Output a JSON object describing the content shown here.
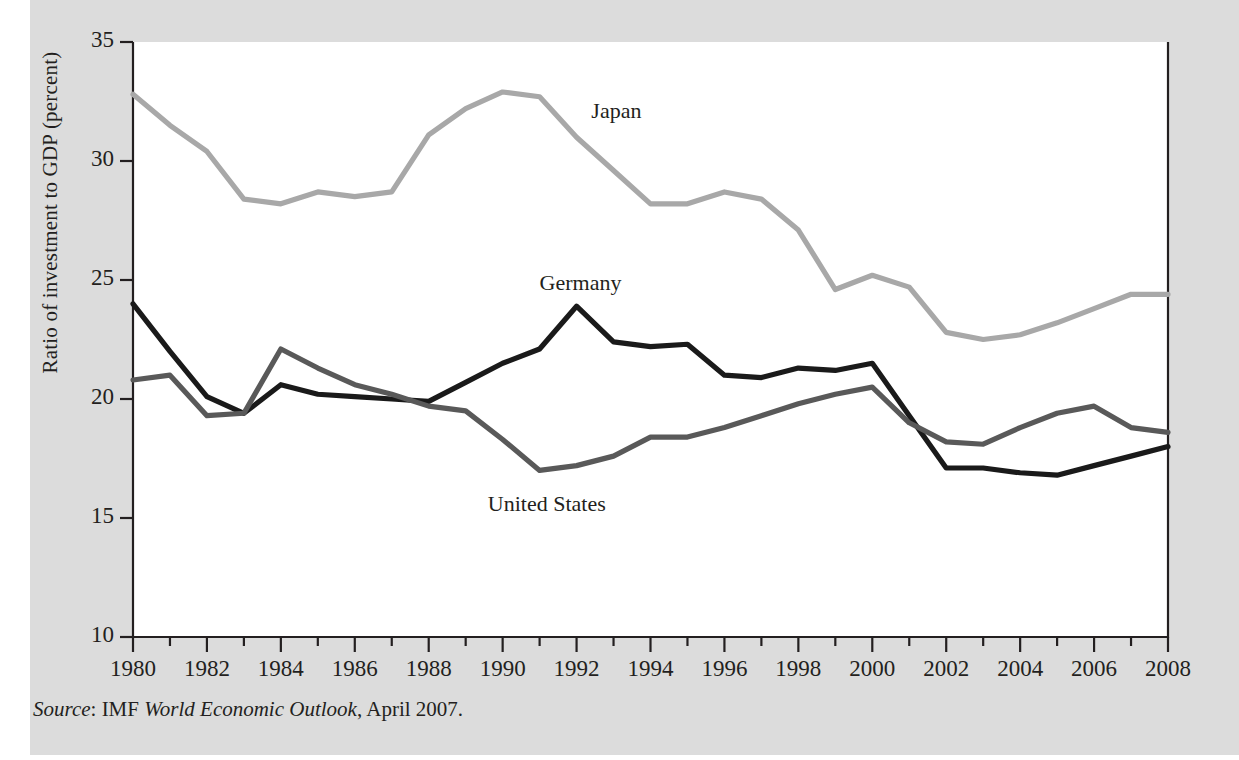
{
  "figure": {
    "source_prefix": "Source",
    "source_text": ": IMF ",
    "source_italic": "World Economic Outlook",
    "source_suffix": ", April 2007."
  },
  "colors": {
    "page_background": "#ffffff",
    "panel_background": "#dcdcdc",
    "plot_background": "#ffffff",
    "axis": "#231f20",
    "japan": "#a8a8a8",
    "germany": "#1a1a1a",
    "united_states": "#595959"
  },
  "chart_data": {
    "type": "line",
    "title": "",
    "xlabel": "",
    "ylabel": "Ratio of investment to GDP (percent)",
    "xlim": [
      1980,
      2008
    ],
    "ylim": [
      10,
      35
    ],
    "grid": false,
    "legend_position": "inline-annotations",
    "yticks": [
      10,
      15,
      20,
      25,
      30,
      35
    ],
    "ytick_labels": [
      "10",
      "15",
      "20",
      "25",
      "30",
      "35"
    ],
    "xticks": [
      1980,
      1982,
      1984,
      1986,
      1988,
      1990,
      1992,
      1994,
      1996,
      1998,
      2000,
      2002,
      2004,
      2006,
      2008
    ],
    "xtick_labels": [
      "1980",
      "1982",
      "1984",
      "1986",
      "1988",
      "1990",
      "1992",
      "1994",
      "1996",
      "1998",
      "2000",
      "2002",
      "2004",
      "2006",
      "2008"
    ],
    "x": [
      1980,
      1981,
      1982,
      1983,
      1984,
      1985,
      1986,
      1987,
      1988,
      1989,
      1990,
      1991,
      1992,
      1993,
      1994,
      1995,
      1996,
      1997,
      1998,
      1999,
      2000,
      2001,
      2002,
      2003,
      2004,
      2005,
      2006,
      2007,
      2008
    ],
    "series": [
      {
        "name": "Japan",
        "color": "#a8a8a8",
        "label_x": 1992.4,
        "label_y": 32.0,
        "values": [
          32.8,
          31.5,
          30.4,
          28.4,
          28.2,
          28.7,
          28.5,
          28.7,
          31.1,
          32.2,
          32.9,
          32.7,
          31.0,
          29.6,
          28.2,
          28.2,
          28.7,
          28.4,
          27.1,
          24.6,
          25.2,
          24.7,
          22.8,
          22.5,
          22.7,
          23.2,
          23.8,
          24.4,
          24.4
        ]
      },
      {
        "name": "Germany",
        "color": "#1a1a1a",
        "label_x": 1991.0,
        "label_y": 24.8,
        "values": [
          24.0,
          22.0,
          20.1,
          19.4,
          20.6,
          20.2,
          20.1,
          20.0,
          19.9,
          20.7,
          21.5,
          22.1,
          23.9,
          22.4,
          22.2,
          22.3,
          21.0,
          20.9,
          21.3,
          21.2,
          21.5,
          19.3,
          17.1,
          17.1,
          16.9,
          16.8,
          17.2,
          17.6,
          18.0
        ]
      },
      {
        "name": "United States",
        "color": "#595959",
        "label_x": 1989.6,
        "label_y": 15.5,
        "values": [
          20.8,
          21.0,
          19.3,
          19.4,
          22.1,
          21.3,
          20.6,
          20.2,
          19.7,
          19.5,
          18.3,
          17.0,
          17.2,
          17.6,
          18.4,
          18.4,
          18.8,
          19.3,
          19.8,
          20.2,
          20.5,
          19.0,
          18.2,
          18.1,
          18.8,
          19.4,
          19.7,
          18.8,
          18.6
        ]
      }
    ]
  }
}
